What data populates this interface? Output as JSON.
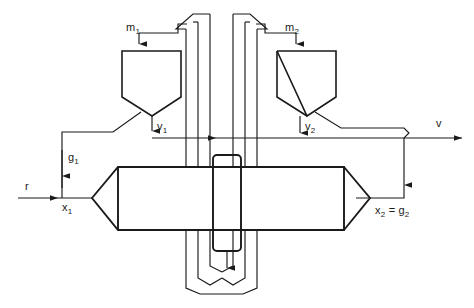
{
  "diagram": {
    "stroke_color": "#1a1a1a",
    "background_color": "#ffffff",
    "labels": {
      "hopper_left_feed": "m",
      "hopper_left_feed_sub": "1",
      "hopper_right_feed": "m",
      "hopper_right_feed_sub": "2",
      "valve_left": "v",
      "valve_left_sub": "1",
      "valve_right": "v",
      "valve_right_sub": "2",
      "output_stream": "v",
      "input_stream": "r",
      "recycle_left": "g",
      "recycle_left_sub": "1",
      "state_left": "x",
      "state_left_sub": "1",
      "state_right": "x",
      "state_right_sub": "2",
      "state_right_equals": "=",
      "state_right_rhs": "g",
      "state_right_rhs_sub": "2"
    }
  }
}
